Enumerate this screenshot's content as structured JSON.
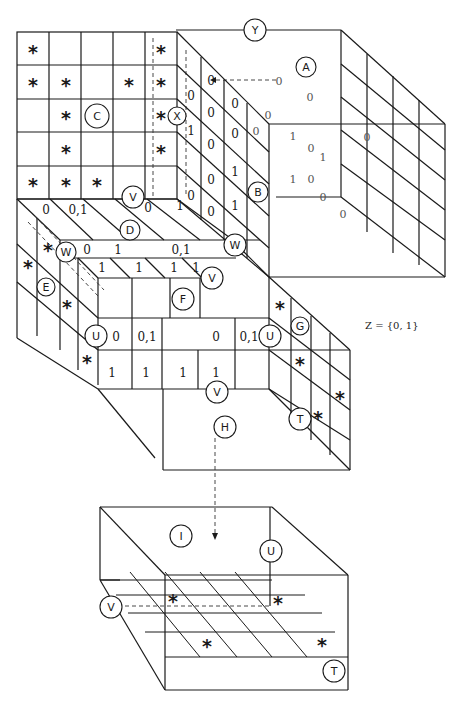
{
  "figure": {
    "type": "3d-cube-decomposition-diagram",
    "set_label": "Z = {0, 1}",
    "circled_labels": {
      "A": "A",
      "B": "B",
      "C": "C",
      "D": "D",
      "E": "E",
      "F": "F",
      "G": "G",
      "H": "H",
      "I": "I",
      "T": "T",
      "U": "U",
      "V": "V",
      "W": "W",
      "X": "X",
      "Y": "Y"
    },
    "front_face_C": {
      "grid": "5x5",
      "stars": [
        [
          0,
          0
        ],
        [
          0,
          4
        ],
        [
          1,
          0
        ],
        [
          1,
          1
        ],
        [
          1,
          3
        ],
        [
          1,
          4
        ],
        [
          2,
          1
        ],
        [
          2,
          4
        ],
        [
          3,
          1
        ],
        [
          3,
          4
        ],
        [
          4,
          0
        ],
        [
          4,
          1
        ],
        [
          4,
          2
        ]
      ]
    },
    "side_face_X_values": {
      "col1": [
        "",
        "0",
        "1",
        "",
        "0"
      ],
      "col2": [
        "0",
        "0",
        "0",
        "0",
        "0"
      ],
      "col3": [
        "",
        "0",
        "0",
        "1",
        "1"
      ]
    },
    "back_cube_A_values": [
      "0",
      "0",
      "0",
      "0",
      "1",
      "0",
      "1",
      "1",
      "0",
      "0",
      "0",
      "0"
    ],
    "face_D_values": [
      "0",
      "0,1",
      "0",
      "1"
    ],
    "face_W_row": [
      "0",
      "1",
      "0,1"
    ],
    "face_F_top_row": [
      "1",
      "1",
      "1",
      "1"
    ],
    "front_U_row": [
      "0",
      "0,1",
      "0",
      "0,1"
    ],
    "front_bottom_row": [
      "1",
      "1",
      "1",
      "1"
    ],
    "side_E_stars": 4,
    "side_G_stars": 4,
    "bottom_slab_I": {
      "stars": 4
    }
  },
  "text": {
    "star": "*",
    "zero": "0",
    "one": "1",
    "zero_one": "0,1"
  }
}
